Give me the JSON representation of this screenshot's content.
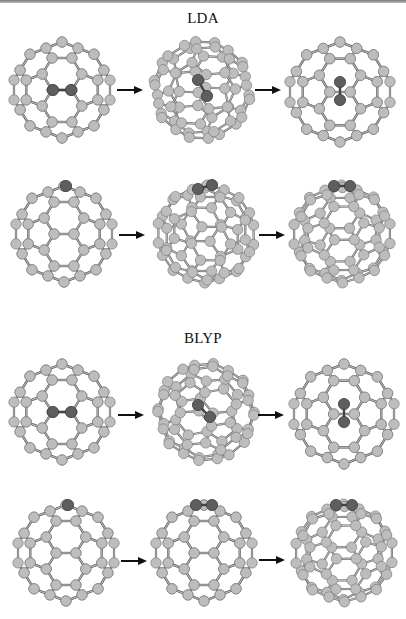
{
  "figure": {
    "sections": [
      {
        "title": "LDA",
        "title_top": 10,
        "rows": [
          {
            "top": 34,
            "panels": [
              {
                "left": 6,
                "size": 112,
                "view": "front-bond",
                "dopant": "center-pair-horizontal"
              },
              {
                "left": 146,
                "size": 112,
                "view": "tilted-a",
                "dopant": "center-pair-diagonal"
              },
              {
                "left": 282,
                "size": 116,
                "view": "side-b",
                "dopant": "center-pair-vertical"
              }
            ],
            "arrows": [
              {
                "left": 117,
                "top": 86
              },
              {
                "left": 255,
                "top": 86
              }
            ]
          },
          {
            "top": 178,
            "panels": [
              {
                "left": 8,
                "size": 112,
                "view": "front-bond",
                "dopant": "top-single"
              },
              {
                "left": 150,
                "size": 112,
                "view": "front-bond-r",
                "dopant": "top-pair-tilted"
              },
              {
                "left": 286,
                "size": 112,
                "view": "front-bond-r2",
                "dopant": "top-pair"
              }
            ],
            "arrows": [
              {
                "left": 119,
                "top": 231
              },
              {
                "left": 259,
                "top": 231
              }
            ]
          }
        ]
      },
      {
        "title": "BLYP",
        "title_top": 330,
        "rows": [
          {
            "top": 356,
            "panels": [
              {
                "left": 6,
                "size": 112,
                "view": "front-bond",
                "dopant": "center-pair-horizontal"
              },
              {
                "left": 150,
                "size": 112,
                "view": "tilted-c",
                "dopant": "center-pair-diagonal-long"
              },
              {
                "left": 286,
                "size": 116,
                "view": "side-b",
                "dopant": "center-pair-vertical"
              }
            ],
            "arrows": [
              {
                "left": 118,
                "top": 411
              },
              {
                "left": 258,
                "top": 411
              }
            ]
          },
          {
            "top": 497,
            "panels": [
              {
                "left": 10,
                "size": 112,
                "view": "front-bond",
                "dopant": "top-single"
              },
              {
                "left": 148,
                "size": 112,
                "view": "front-bond",
                "dopant": "top-pair"
              },
              {
                "left": 288,
                "size": 112,
                "view": "front-bond-r2",
                "dopant": "top-pair"
              }
            ],
            "arrows": [
              {
                "left": 121,
                "top": 557
              },
              {
                "left": 259,
                "top": 556
              }
            ]
          }
        ]
      }
    ],
    "colors": {
      "atom_fill": "#bdbdbd",
      "atom_stroke": "#7d7d7d",
      "dopant_fill": "#5e5e5e",
      "dopant_stroke": "#3a3a3a",
      "bond": "#6a6a6a",
      "text": "#111111",
      "arrow": "#111111"
    },
    "icons": {
      "arrow": "right-arrow-icon",
      "atom": "carbon-atom-icon",
      "dopant": "dopant-atom-icon"
    }
  }
}
